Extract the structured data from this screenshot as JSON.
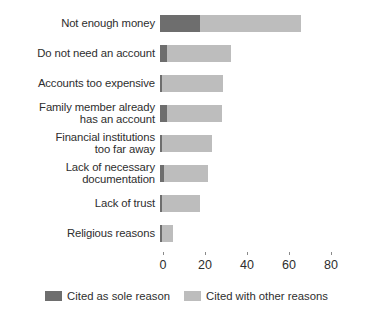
{
  "chart_data": {
    "type": "bar",
    "orientation": "horizontal",
    "stacked": true,
    "title": "",
    "subtitle": "",
    "xlabel": "",
    "ylabel": "",
    "xlim": [
      0,
      88
    ],
    "xticks": [
      0,
      20,
      40,
      60,
      80
    ],
    "xtick_labels": [
      "0",
      "20",
      "40",
      "60",
      "80"
    ],
    "grid": false,
    "legend_position": "bottom-center",
    "categories": [
      "Not enough money",
      "Do not need an account",
      "Accounts too expensive",
      "Family member already\nhas an account",
      "Financial institutions\ntoo far away",
      "Lack of necessary\ndocumentation",
      "Lack of trust",
      "Religious reasons"
    ],
    "series": [
      {
        "name": "Cited as sole reason",
        "color": "#6e6e6e",
        "values": [
          19,
          3.5,
          1,
          3.5,
          1,
          2,
          1,
          1
        ]
      },
      {
        "name": "Cited with other reasons",
        "color": "#bdbdbd",
        "values": [
          48,
          30.5,
          29,
          26,
          24,
          21,
          18,
          5
        ]
      }
    ],
    "totals": [
      67,
      34,
      30,
      29.5,
      25,
      23,
      19,
      6
    ]
  },
  "legend": {
    "items": [
      {
        "label": "Cited as sole reason",
        "color": "#6e6e6e"
      },
      {
        "label": "Cited with other reasons",
        "color": "#bdbdbd"
      }
    ]
  }
}
